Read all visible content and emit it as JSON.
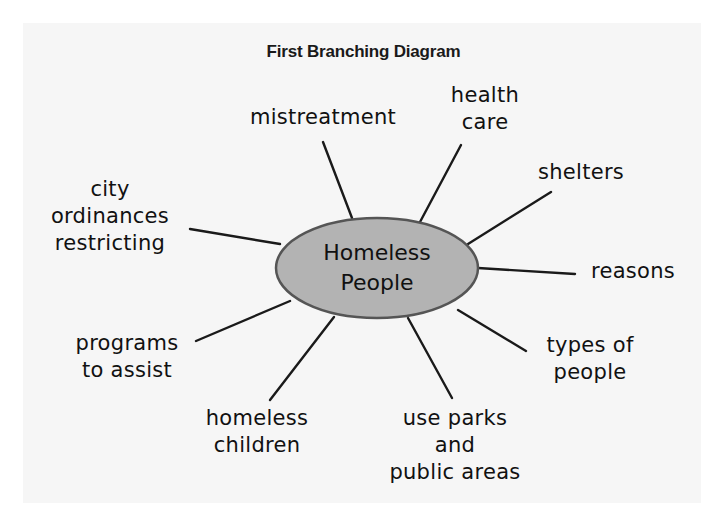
{
  "title": "First Branching Diagram",
  "center": {
    "lines": [
      "Homeless",
      "People"
    ],
    "fill": "#b3b3b3",
    "stroke": "#555555"
  },
  "branches": [
    {
      "id": "mistreatment",
      "lines": [
        "mistreatment"
      ]
    },
    {
      "id": "health-care",
      "lines": [
        "health",
        "care"
      ]
    },
    {
      "id": "shelters",
      "lines": [
        "shelters"
      ]
    },
    {
      "id": "reasons",
      "lines": [
        "reasons"
      ]
    },
    {
      "id": "types-of-people",
      "lines": [
        "types of",
        "people"
      ]
    },
    {
      "id": "use-parks",
      "lines": [
        "use parks",
        "and",
        "public areas"
      ]
    },
    {
      "id": "homeless-children",
      "lines": [
        "homeless",
        "children"
      ]
    },
    {
      "id": "programs-to-assist",
      "lines": [
        "programs",
        "to assist"
      ]
    },
    {
      "id": "city-ordinances",
      "lines": [
        "city",
        "ordinances",
        "restricting"
      ]
    }
  ],
  "colors": {
    "panel": "#f6f6f6",
    "line": "#1a1a1a",
    "text": "#111111"
  }
}
